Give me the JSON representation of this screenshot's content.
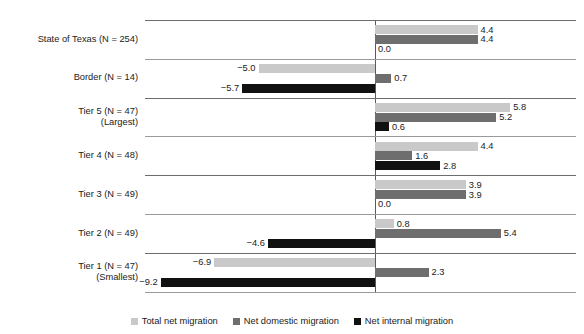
{
  "chart_data": {
    "type": "bar",
    "orientation": "horizontal",
    "title": "",
    "xlabel": "",
    "ylabel": "",
    "grid": false,
    "zero_line": true,
    "legend_position": "bottom",
    "categories": [
      "State of Texas (N = 254)",
      "Border (N = 14)",
      "Tier 5 (N = 47)\n(Largest)",
      "Tier 4 (N = 48)",
      "Tier 3 (N = 49)",
      "Tier 2 (N = 49)",
      "Tier 1 (N = 47)\n(Smallest)"
    ],
    "category_lines": [
      [
        "State of Texas (N = 254)"
      ],
      [
        "Border (N = 14)"
      ],
      [
        "Tier 5 (N = 47)",
        "(Largest)"
      ],
      [
        "Tier 4 (N = 48)"
      ],
      [
        "Tier 3 (N = 49)"
      ],
      [
        "Tier 2 (N = 49)"
      ],
      [
        "Tier 1 (N = 47)",
        "(Smallest)"
      ]
    ],
    "series": [
      {
        "name": "Total net migration",
        "color": "#c9c9c9",
        "values": [
          4.4,
          -5.0,
          5.8,
          4.4,
          3.9,
          0.8,
          -6.9
        ],
        "labels": [
          "4.4",
          "−5.0",
          "5.8",
          "4.4",
          "3.9",
          "0.8",
          "−6.9"
        ]
      },
      {
        "name": "Net domestic migration",
        "color": "#6e6e6e",
        "values": [
          4.4,
          0.7,
          5.2,
          1.6,
          3.9,
          5.4,
          2.3
        ],
        "labels": [
          "4.4",
          "0.7",
          "5.2",
          "1.6",
          "3.9",
          "5.4",
          "2.3"
        ]
      },
      {
        "name": "Net internal migration",
        "color": "#111111",
        "values": [
          0.0,
          -5.7,
          0.6,
          2.8,
          0.0,
          -4.6,
          -9.2
        ],
        "labels": [
          "0.0",
          "−5.7",
          "0.6",
          "2.8",
          "0.0",
          "−4.6",
          "−9.2"
        ]
      }
    ],
    "xlim": [
      -9.8,
      9.0
    ]
  },
  "legend": {
    "items": [
      {
        "label": "Total net migration",
        "color": "#c9c9c9"
      },
      {
        "label": "Net domestic migration",
        "color": "#6e6e6e"
      },
      {
        "label": "Net internal migration",
        "color": "#111111"
      }
    ]
  },
  "colors": {
    "series_light": "#c9c9c9",
    "series_medium": "#6e6e6e",
    "series_dark": "#111111",
    "separator": "#6d6d6d",
    "axis": "#5a5a5a",
    "text": "#1a1a1a",
    "background": "#ffffff"
  }
}
